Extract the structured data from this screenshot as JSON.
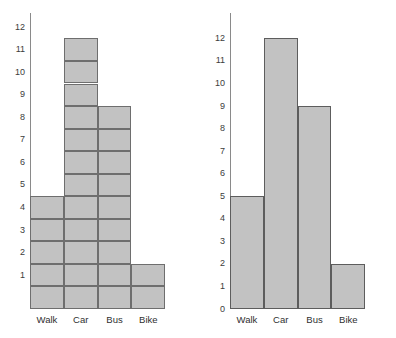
{
  "chart_data": [
    {
      "type": "bar",
      "variant": "gridded-unit-bar",
      "title": "",
      "xlabel": "",
      "ylabel": "",
      "categories": [
        "Walk",
        "Car",
        "Bus",
        "Bike"
      ],
      "values": [
        5,
        12,
        9,
        2
      ],
      "ytick_labels": [
        "1",
        "2",
        "3",
        "4",
        "5",
        "6",
        "7",
        "8",
        "9",
        "10",
        "11",
        "12"
      ],
      "ylim": [
        0,
        12
      ],
      "grid": true,
      "legend": "none",
      "tick_label_placement": "cell-centered",
      "colors": {
        "bar_fill": "#c2c2c2",
        "bar_edge": "#6e6e6e",
        "axis": "#8a8a8a",
        "text": "#3c3c3c",
        "background": "#ffffff"
      }
    },
    {
      "type": "bar",
      "variant": "standard-bar",
      "title": "",
      "xlabel": "",
      "ylabel": "",
      "categories": [
        "Walk",
        "Car",
        "Bus",
        "Bike"
      ],
      "values": [
        5,
        12,
        9,
        2
      ],
      "ytick_labels": [
        "0",
        "1",
        "2",
        "3",
        "4",
        "5",
        "6",
        "7",
        "8",
        "9",
        "10",
        "11",
        "12"
      ],
      "ylim": [
        0,
        12
      ],
      "grid": false,
      "legend": "none",
      "tick_label_placement": "gridline",
      "colors": {
        "bar_fill": "#c2c2c2",
        "bar_edge": "#5d5d5d",
        "axis": "#8a8a8a",
        "text": "#3c3c3c",
        "background": "#ffffff"
      }
    }
  ]
}
